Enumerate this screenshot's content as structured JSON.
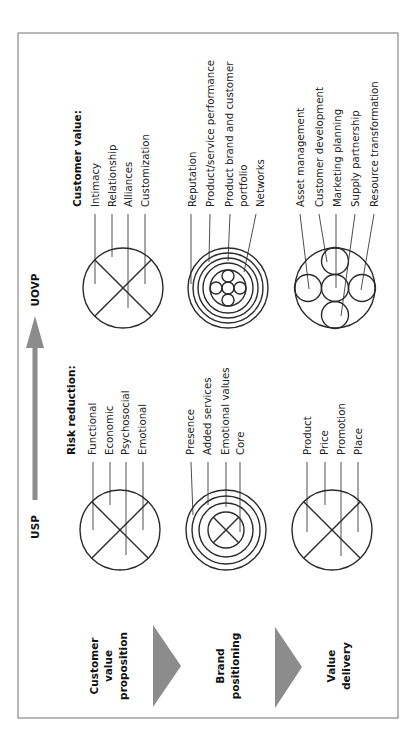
{
  "orientation": "rotated 90 degrees counter-clockwise",
  "axis": {
    "start_label": "USP",
    "end_label": "UOVP",
    "color": "#8c8c8c"
  },
  "stages": [
    {
      "lines": [
        "Customer",
        "value",
        "proposition"
      ]
    },
    {
      "lines": [
        "Brand",
        "positioning"
      ]
    },
    {
      "lines": [
        "Value",
        "delivery"
      ]
    }
  ],
  "usp": {
    "customer_value_proposition": {
      "heading": "Risk reduction:",
      "items": [
        "Functional",
        "Economic",
        "Psychosocial",
        "Emotional"
      ],
      "icon": "circle-with-x"
    },
    "brand_positioning": {
      "items": [
        "Presence",
        "Added services",
        "Emotional values",
        "Core"
      ],
      "icon": "concentric-rings-with-x-core"
    },
    "value_delivery": {
      "items": [
        "Product",
        "Price",
        "Promotion",
        "Place"
      ],
      "icon": "circle-with-x"
    }
  },
  "uovp": {
    "customer_value_proposition": {
      "heading": "Customer value:",
      "items": [
        "Intimacy",
        "Relationship",
        "Alliances",
        "Customization"
      ],
      "icon": "circle-with-x"
    },
    "brand_positioning": {
      "items": [
        "Reputation",
        "Product/service performance",
        "Product brand and customer",
        "portfolio",
        "Networks"
      ],
      "icon": "concentric-rings-with-circle-cluster"
    },
    "value_delivery": {
      "items": [
        "Asset management",
        "Customer development",
        "Marketing planning",
        "Supply partnership",
        "Resource transformation"
      ],
      "icon": "circle-with-five-circles"
    }
  }
}
